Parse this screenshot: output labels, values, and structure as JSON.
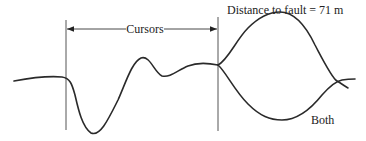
{
  "labels": {
    "cursors": "Cursors",
    "distance": "Distance to fault = 71 m",
    "both": "Both"
  },
  "colors": {
    "trace": "#2a2a2a",
    "cursor": "#555555",
    "text": "#222222",
    "background": "#ffffff"
  },
  "cursors": {
    "left_x": 66,
    "right_x": 218
  }
}
